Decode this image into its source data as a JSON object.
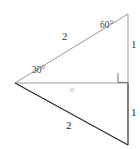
{
  "figure": {
    "canvas": {
      "width": 140,
      "height": 149,
      "background": "#ffffff"
    },
    "colors": {
      "upper_stroke": "#9a9a9a",
      "lower_stroke": "#2b2b2b",
      "base_stroke": "#9a9a9a",
      "right_angle_mark": "#6e6e6e",
      "faint_label": "#b9b9b9"
    },
    "vertices": {
      "left_apex": {
        "x": 15,
        "y": 83
      },
      "top_right": {
        "x": 128,
        "y": 14
      },
      "right_angle": {
        "x": 128,
        "y": 83
      },
      "bottom_right": {
        "x": 128,
        "y": 145
      }
    },
    "labels": {
      "upper_hypotenuse": "2",
      "angle_top": "60°",
      "upper_leg": "1",
      "angle_left": "30°",
      "base": "a",
      "lower_hypotenuse": "2",
      "lower_leg": "1"
    }
  }
}
